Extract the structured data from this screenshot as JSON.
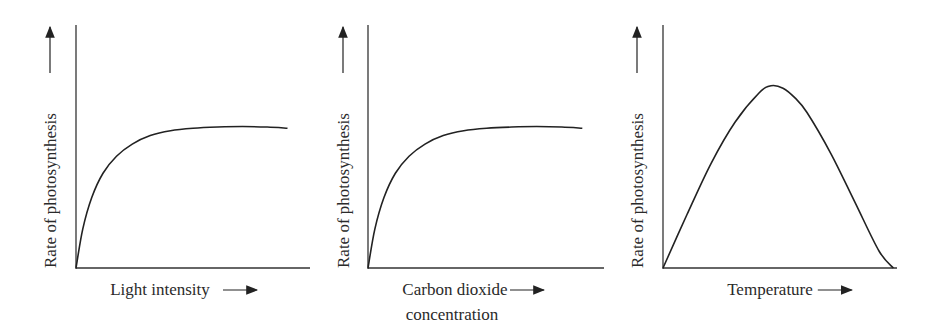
{
  "chart_data": [
    {
      "type": "line",
      "title": "",
      "xlabel": "Light intensity",
      "ylabel": "Rate of photosynthesis",
      "xlim": [
        0,
        10
      ],
      "ylim": [
        0,
        10
      ],
      "grid": false,
      "series": [
        {
          "name": "rate",
          "x": [
            0,
            0.3,
            0.7,
            1.2,
            1.8,
            2.5,
            3.3,
            4.2,
            5.2,
            6.3,
            7.4,
            8.5,
            9.4
          ],
          "y": [
            0,
            1.6,
            2.9,
            3.9,
            4.6,
            5.1,
            5.45,
            5.65,
            5.75,
            5.8,
            5.82,
            5.8,
            5.75
          ]
        }
      ]
    },
    {
      "type": "line",
      "title": "",
      "xlabel": "Carbon dioxide concentration",
      "ylabel": "Rate of photosynthesis",
      "xlim": [
        0,
        10
      ],
      "ylim": [
        0,
        10
      ],
      "grid": false,
      "series": [
        {
          "name": "rate",
          "x": [
            0,
            0.3,
            0.7,
            1.2,
            1.8,
            2.5,
            3.3,
            4.2,
            5.2,
            6.3,
            7.4,
            8.5,
            9.4
          ],
          "y": [
            0,
            1.6,
            2.9,
            3.9,
            4.6,
            5.1,
            5.45,
            5.65,
            5.75,
            5.8,
            5.82,
            5.8,
            5.75
          ]
        }
      ]
    },
    {
      "type": "line",
      "title": "",
      "xlabel": "Temperature",
      "ylabel": "Rate of photosynthesis",
      "xlim": [
        0,
        10
      ],
      "ylim": [
        0,
        10
      ],
      "grid": false,
      "series": [
        {
          "name": "rate",
          "x": [
            0,
            1,
            2,
            3,
            4,
            4.5,
            5,
            5.5,
            6,
            7,
            8,
            9,
            9.6
          ],
          "y": [
            0,
            2.2,
            4.3,
            6,
            7.2,
            7.5,
            7.4,
            7.0,
            6.4,
            4.7,
            2.7,
            0.7,
            0
          ]
        }
      ]
    }
  ],
  "arrow": "→"
}
